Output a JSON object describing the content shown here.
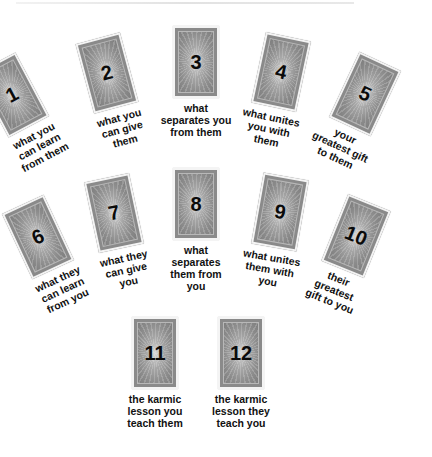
{
  "spread": {
    "title": "",
    "cards": [
      {
        "number": "1",
        "caption": [
          "what you",
          "can learn",
          "from them"
        ],
        "x": 12,
        "y": 95,
        "rot": -28
      },
      {
        "number": "2",
        "caption": [
          "what you",
          "can give",
          "them"
        ],
        "x": 107,
        "y": 73,
        "rot": -15
      },
      {
        "number": "3",
        "caption": [
          "what",
          "separates you",
          "from them"
        ],
        "x": 196,
        "y": 62,
        "rot": 0
      },
      {
        "number": "4",
        "caption": [
          "what unites",
          "you with",
          "them"
        ],
        "x": 281,
        "y": 72,
        "rot": 12
      },
      {
        "number": "5",
        "caption": [
          "your",
          "greatest gift",
          "to them"
        ],
        "x": 365,
        "y": 94,
        "rot": 25
      },
      {
        "number": "6",
        "caption": [
          "what they",
          "can learn",
          "from you"
        ],
        "x": 38,
        "y": 237,
        "rot": -25
      },
      {
        "number": "7",
        "caption": [
          "what they",
          "can give",
          "you"
        ],
        "x": 114,
        "y": 213,
        "rot": -12
      },
      {
        "number": "8",
        "caption": [
          "what",
          "separates",
          "them from",
          "you"
        ],
        "x": 196,
        "y": 204,
        "rot": 0
      },
      {
        "number": "9",
        "caption": [
          "what unites",
          "them with",
          "you"
        ],
        "x": 280,
        "y": 212,
        "rot": 10
      },
      {
        "number": "10",
        "caption": [
          "their",
          "greatest",
          "gift to you"
        ],
        "x": 356,
        "y": 236,
        "rot": 22
      },
      {
        "number": "11",
        "caption": [
          "the karmic",
          "lesson you",
          "teach them"
        ],
        "x": 155,
        "y": 353,
        "rot": 0
      },
      {
        "number": "12",
        "caption": [
          "the karmic",
          "lesson they",
          "teach you"
        ],
        "x": 241,
        "y": 353,
        "rot": 0
      }
    ]
  }
}
